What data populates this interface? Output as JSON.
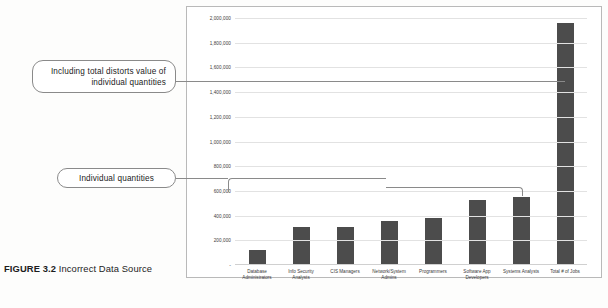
{
  "figure": {
    "number_label": "FIGURE 3.2",
    "title": " Incorrect Data Source"
  },
  "annotations": {
    "total_callout": "Including total distorts value of individual quantities",
    "individual_callout": "Individual quantities"
  },
  "colors": {
    "bar": "#4c4c4c",
    "gridline": "#e2e2e2",
    "frame": "#b9b9b9",
    "callout_border": "#8a8a8a"
  },
  "chart_data": {
    "type": "bar",
    "title": "",
    "xlabel": "",
    "ylabel": "",
    "ylim": [
      0,
      2000000
    ],
    "grid": true,
    "legend": "none",
    "categories": [
      "Database Administrators",
      "Info Security Analysts",
      "CIS Managers",
      "Network/System Admins",
      "Programmers",
      "Software App Developers",
      "Systems Analysts",
      "Total # of Jobs"
    ],
    "values": [
      120000,
      305000,
      310000,
      355000,
      380000,
      525000,
      550000,
      1960000
    ],
    "ytick_labels": [
      "2,000,000",
      "1,800,000",
      "1,600,000",
      "1,400,000",
      "1,200,000",
      "1,000,000",
      "800,000",
      "600,000",
      "400,000",
      "200,000",
      "-"
    ],
    "ytick_values": [
      2000000,
      1800000,
      1600000,
      1400000,
      1200000,
      1000000,
      800000,
      600000,
      400000,
      200000,
      0
    ]
  }
}
